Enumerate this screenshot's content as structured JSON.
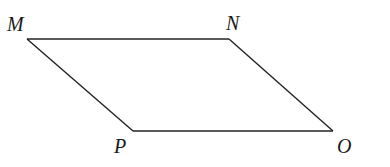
{
  "diagram": {
    "type": "parallelogram",
    "vertices": [
      {
        "id": "M",
        "label": "M"
      },
      {
        "id": "N",
        "label": "N"
      },
      {
        "id": "O",
        "label": "O"
      },
      {
        "id": "P",
        "label": "P"
      }
    ],
    "edges": [
      [
        "M",
        "N"
      ],
      [
        "N",
        "O"
      ],
      [
        "O",
        "P"
      ],
      [
        "P",
        "M"
      ]
    ],
    "colors": {
      "stroke": "#222222",
      "label": "#1a1a1a",
      "background": "#ffffff"
    }
  }
}
